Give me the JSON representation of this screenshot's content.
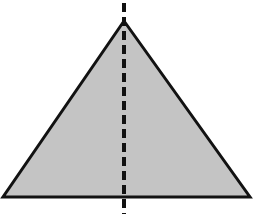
{
  "figure": {
    "title": "Isosceles triangle with vertical line of symmetry",
    "canvas": {
      "width": 261,
      "height": 217,
      "background": "#ffffff"
    },
    "shapes": {
      "triangle": {
        "name": "shaded-triangle",
        "apex": {
          "x": 124,
          "y": 21
        },
        "base_left": {
          "x": 3,
          "y": 197
        },
        "base_right": {
          "x": 250,
          "y": 197
        },
        "points": "124,21 3,197 250,197",
        "fill": "#c4c4c4",
        "stroke": "#121212",
        "stroke_width": 3
      },
      "symmetry_line": {
        "name": "dashed-symmetry-axis",
        "x": 124,
        "y_start": 3,
        "y_end": 214,
        "stroke": "#111111",
        "stroke_width": 4,
        "dash_length": 9,
        "gap_length": 5,
        "dasharray": "9,5"
      }
    }
  },
  "chart_data": {
    "type": "diagram",
    "title": "Isosceles triangle with vertical line of symmetry",
    "xlabel": "",
    "ylabel": "",
    "elements": [
      {
        "kind": "polygon",
        "label": "triangle",
        "vertices": [
          [
            124,
            21
          ],
          [
            3,
            197
          ],
          [
            250,
            197
          ]
        ],
        "fill": "#c4c4c4",
        "stroke": "#121212"
      },
      {
        "kind": "line",
        "label": "line of symmetry",
        "style": "dashed",
        "from": [
          124,
          3
        ],
        "to": [
          124,
          214
        ],
        "stroke": "#111111"
      }
    ]
  }
}
